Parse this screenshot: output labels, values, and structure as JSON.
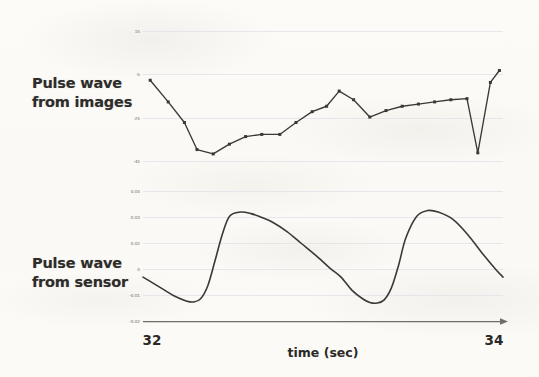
{
  "figure": {
    "background_color": "#fbfaf7",
    "line_color": "#3b3936",
    "gridline_color": "#d8dde4",
    "axis_color": "#6f6d69"
  },
  "panels": [
    {
      "id": "pulse-wave-from-images",
      "label": "Pulse wave\nfrom images",
      "y_ticks": [
        "15",
        "-5",
        "-25",
        "-45"
      ]
    },
    {
      "id": "pulse-wave-from-sensor",
      "label": "Pulse wave\nfrom sensor",
      "y_ticks": [
        "0.04",
        "0.03",
        "0.02",
        "0",
        "-0.01",
        "-0.02"
      ]
    }
  ],
  "x_axis": {
    "title": "time (sec)",
    "ticks": [
      "32",
      "34"
    ]
  },
  "chart_data": [
    {
      "type": "line",
      "title": "Pulse wave from images",
      "xlabel": "time (sec)",
      "ylabel": "",
      "xlim": [
        32,
        34
      ],
      "ylim": [
        -45,
        15
      ],
      "grid": true,
      "legend": "none",
      "markers": "square",
      "yticks": [
        15,
        -5,
        -25,
        -45
      ],
      "xticks": [
        32,
        34
      ],
      "x": [
        32.04,
        32.14,
        32.23,
        32.3,
        32.39,
        32.48,
        32.57,
        32.66,
        32.76,
        32.85,
        32.94,
        33.02,
        33.09,
        33.17,
        33.26,
        33.35,
        33.44,
        33.53,
        33.62,
        33.71,
        33.8,
        33.86,
        33.93,
        33.98
      ],
      "y": [
        -7.5,
        -17.5,
        -27.0,
        -39.5,
        -41.5,
        -37.0,
        -33.5,
        -32.5,
        -32.5,
        -27.0,
        -22.0,
        -19.5,
        -12.5,
        -16.5,
        -24.5,
        -21.5,
        -19.5,
        -18.5,
        -17.5,
        -16.5,
        -16.0,
        -41.0,
        -8.5,
        -3.0
      ]
    },
    {
      "type": "line",
      "title": "Pulse wave from sensor",
      "xlabel": "time (sec)",
      "ylabel": "",
      "xlim": [
        32,
        34
      ],
      "ylim": [
        -0.02,
        0.045
      ],
      "grid": true,
      "legend": "none",
      "markers": "none",
      "yticks": [
        0.04,
        0.03,
        0.02,
        0,
        -0.01,
        -0.02
      ],
      "xticks": [
        32,
        34
      ],
      "x": [
        32.0,
        32.06,
        32.12,
        32.18,
        32.24,
        32.28,
        32.32,
        32.36,
        32.4,
        32.44,
        32.48,
        32.54,
        32.6,
        32.66,
        32.72,
        32.8,
        32.88,
        32.96,
        33.04,
        33.1,
        33.16,
        33.22,
        33.26,
        33.3,
        33.34,
        33.38,
        33.42,
        33.46,
        33.52,
        33.58,
        33.64,
        33.72,
        33.8,
        33.88,
        33.96,
        34.0
      ],
      "y": [
        0.0005,
        -0.0025,
        -0.0055,
        -0.0085,
        -0.0105,
        -0.011,
        -0.0095,
        -0.0035,
        0.008,
        0.02,
        0.0285,
        0.0305,
        0.0298,
        0.028,
        0.0258,
        0.0215,
        0.016,
        0.0105,
        0.0045,
        0.0005,
        -0.0055,
        -0.0095,
        -0.0112,
        -0.0115,
        -0.01,
        -0.0045,
        0.006,
        0.0185,
        0.0285,
        0.0312,
        0.0305,
        0.0272,
        0.0205,
        0.012,
        0.004,
        0.0005
      ]
    }
  ]
}
